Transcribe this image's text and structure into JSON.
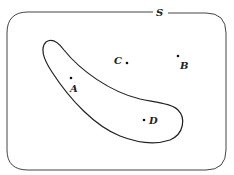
{
  "diagram": {
    "universe_label": "S",
    "colors": {
      "stroke": "#333333",
      "background": "#ffffff",
      "text": "#222222"
    },
    "points": [
      {
        "label": "A",
        "dot": [
          71,
          78
        ],
        "text_pos": [
          70,
          92
        ]
      },
      {
        "label": "B",
        "dot": [
          178,
          56
        ],
        "text_pos": [
          180,
          69
        ]
      },
      {
        "label": "C",
        "dot": [
          127,
          63
        ],
        "text_pos": [
          114,
          64
        ]
      },
      {
        "label": "D",
        "dot": [
          144,
          120
        ],
        "text_pos": [
          149,
          124
        ]
      }
    ],
    "region": {
      "description": "curved elongated set containing A and D"
    }
  }
}
